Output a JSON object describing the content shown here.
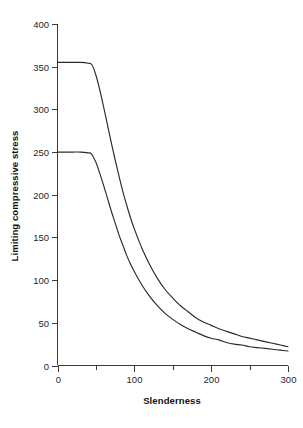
{
  "chart_data": {
    "type": "line",
    "title": "",
    "xlabel": "Slenderness",
    "ylabel": "Limiting compressive stress",
    "xlim": [
      0,
      300
    ],
    "ylim": [
      0,
      400
    ],
    "grid": false,
    "legend": false,
    "legend_position": "none",
    "x_ticks": [
      0,
      100,
      200,
      300
    ],
    "x_tick_labels": [
      "0",
      "100",
      "200",
      "300"
    ],
    "x_minor_ticks": [
      50,
      150,
      250
    ],
    "y_ticks": [
      0,
      50,
      100,
      150,
      200,
      250,
      300,
      350,
      400
    ],
    "y_tick_labels": [
      "0",
      "50",
      "100",
      "150",
      "200",
      "250",
      "300",
      "350",
      "400"
    ],
    "line_color": "#2b2b2b",
    "background_color": "#ffffff",
    "series": [
      {
        "name": "upper curve",
        "plateau_value": 355,
        "plateau_end_x": 45,
        "x": [
          0,
          10,
          20,
          30,
          40,
          45,
          50,
          55,
          60,
          65,
          70,
          75,
          80,
          85,
          90,
          95,
          100,
          110,
          120,
          130,
          140,
          150,
          160,
          170,
          180,
          190,
          200,
          210,
          220,
          230,
          240,
          250,
          260,
          270,
          280,
          290,
          300
        ],
        "values": [
          355,
          355,
          355,
          355,
          354,
          352,
          340,
          323,
          303,
          282,
          261,
          241,
          222,
          204,
          188,
          173,
          160,
          137,
          118,
          102,
          89,
          79,
          70,
          63,
          56,
          51,
          47,
          43,
          40,
          37,
          34,
          32,
          30,
          28,
          26,
          24,
          22
        ]
      },
      {
        "name": "lower curve",
        "plateau_value": 250,
        "plateau_end_x": 44,
        "x": [
          0,
          10,
          20,
          30,
          40,
          44,
          50,
          55,
          60,
          65,
          70,
          75,
          80,
          85,
          90,
          95,
          100,
          110,
          120,
          130,
          140,
          150,
          160,
          170,
          180,
          190,
          200,
          210,
          220,
          230,
          240,
          250,
          260,
          270,
          280,
          290,
          300
        ],
        "values": [
          250,
          250,
          250,
          250,
          249,
          248,
          238,
          225,
          211,
          196,
          181,
          167,
          153,
          141,
          129,
          119,
          110,
          94,
          81,
          70,
          61,
          54,
          48,
          43,
          39,
          35,
          32,
          30,
          27,
          25,
          24,
          22,
          21,
          20,
          19,
          18,
          17
        ]
      }
    ]
  },
  "axes": {
    "x_title": "Slenderness",
    "y_title": "Limiting compressive stress"
  }
}
